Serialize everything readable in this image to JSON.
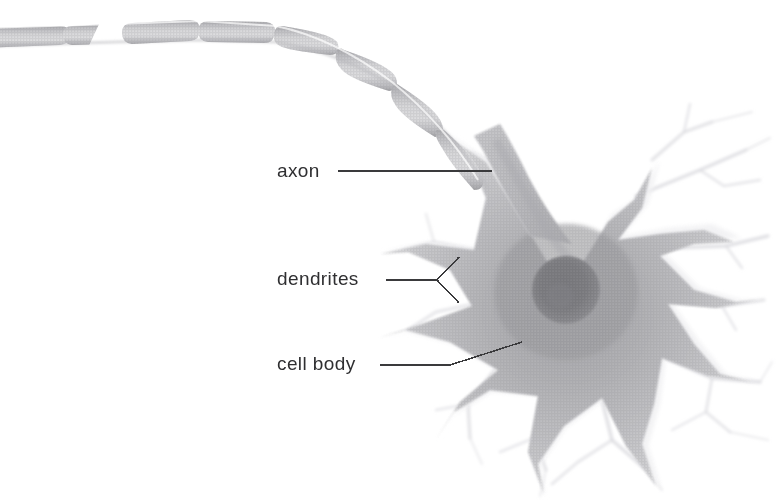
{
  "figure": {
    "background_color": "#ffffff",
    "width": 776,
    "height": 503,
    "style": "halftone grayscale textbook illustration"
  },
  "labels": {
    "axon": "axon",
    "dendrites": "dendrites",
    "cell_body": "cell body"
  },
  "leader_lines": {
    "axon": {
      "type": "straight",
      "from": [
        338,
        171
      ],
      "to": [
        492,
        171
      ],
      "color": "#3a3a3c"
    },
    "dendrites": {
      "type": "forked",
      "from": [
        386,
        280
      ],
      "vertex": [
        437,
        280
      ],
      "branches": [
        [
          459,
          257
        ],
        [
          459,
          303
        ]
      ],
      "color": "#3a3a3c"
    },
    "cell_body": {
      "type": "bent",
      "from": [
        380,
        365
      ],
      "bend": [
        450,
        365
      ],
      "to": [
        522,
        342
      ],
      "color": "#3a3a3c"
    }
  },
  "anatomy": {
    "soma": {
      "name": "cell body",
      "center": [
        565,
        292
      ],
      "approx_radius": 78,
      "fill": "#cfcfd1",
      "shape": "star-shaped multipolar"
    },
    "nucleus": {
      "name": "nucleus",
      "center": [
        566,
        290
      ],
      "radius": 33,
      "fill": "#9a9a9d"
    },
    "axon": {
      "name": "myelinated axon",
      "myelin_segments": 9,
      "has_break": true,
      "break_location": [
        112,
        36
      ],
      "description": "curved myelinated axon entering from upper left, descending to the soma"
    },
    "dendrites": {
      "name": "dendrites",
      "count": 11,
      "description": "thick radiating processes that taper and branch into fine pale tips"
    }
  },
  "colors": {
    "label_text": "#2f2f31",
    "leader_line": "#3a3a3c",
    "soma_mid": "#c9c9cb",
    "soma_edge": "#e8e8ea",
    "nucleus": "#9a9a9d",
    "myelin_light": "#f4f4f5",
    "myelin_shadow": "#a9a9ac",
    "dendrite_faint": "#eaeaec"
  }
}
